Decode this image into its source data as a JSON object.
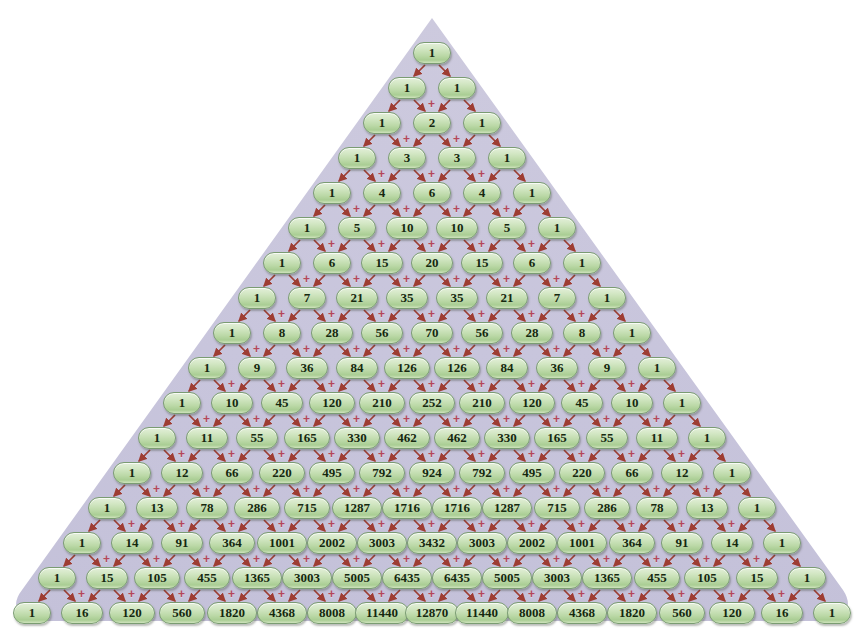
{
  "figure": {
    "name": "pascals-triangle",
    "rows_count": 17,
    "background_color": "#c9c6de",
    "cell_fill_color": "#bcd9a8",
    "cell_border_color": "#7a9c72",
    "cell_text_color": "#15280f",
    "arrow_color": "#9e3d33",
    "plus_color": "#b4465a",
    "plus_label": "+",
    "canvas_color": "#ffffff"
  },
  "chart_data": {
    "type": "table",
    "xlabel": "",
    "ylabel": "",
    "rows": [
      [
        1
      ],
      [
        1,
        1
      ],
      [
        1,
        2,
        1
      ],
      [
        1,
        3,
        3,
        1
      ],
      [
        1,
        4,
        6,
        4,
        1
      ],
      [
        1,
        5,
        10,
        10,
        5,
        1
      ],
      [
        1,
        6,
        15,
        20,
        15,
        6,
        1
      ],
      [
        1,
        7,
        21,
        35,
        35,
        21,
        7,
        1
      ],
      [
        1,
        8,
        28,
        56,
        70,
        56,
        28,
        8,
        1
      ],
      [
        1,
        9,
        36,
        84,
        126,
        126,
        84,
        36,
        9,
        1
      ],
      [
        1,
        10,
        45,
        120,
        210,
        252,
        210,
        120,
        45,
        10,
        1
      ],
      [
        1,
        11,
        55,
        165,
        330,
        462,
        462,
        330,
        165,
        55,
        11,
        1
      ],
      [
        1,
        12,
        66,
        220,
        495,
        792,
        924,
        792,
        495,
        220,
        66,
        12,
        1
      ],
      [
        1,
        13,
        78,
        286,
        715,
        1287,
        1716,
        1716,
        1287,
        715,
        286,
        78,
        13,
        1
      ],
      [
        1,
        14,
        91,
        364,
        1001,
        2002,
        3003,
        3432,
        3003,
        2002,
        1001,
        364,
        91,
        14,
        1
      ],
      [
        1,
        15,
        105,
        455,
        1365,
        3003,
        5005,
        6435,
        6435,
        5005,
        3003,
        1365,
        455,
        105,
        15,
        1
      ],
      [
        1,
        16,
        120,
        560,
        1820,
        4368,
        8008,
        11440,
        12870,
        11440,
        8008,
        4368,
        1820,
        560,
        120,
        16,
        1
      ]
    ],
    "row_labels": [
      "n=0",
      "n=1",
      "n=2",
      "n=3",
      "n=4",
      "n=5",
      "n=6",
      "n=7",
      "n=8",
      "n=9",
      "n=10",
      "n=11",
      "n=12",
      "n=13",
      "n=14",
      "n=15",
      "n=16"
    ],
    "operator_between_cells": "+",
    "annotation": "Each entry is the sum of the two entries above it."
  },
  "layout": {
    "apex_center_x": 432,
    "first_row_center_y": 53,
    "row_pitch_y": 35,
    "column_pitch_x": 50,
    "cell_height": 22
  }
}
